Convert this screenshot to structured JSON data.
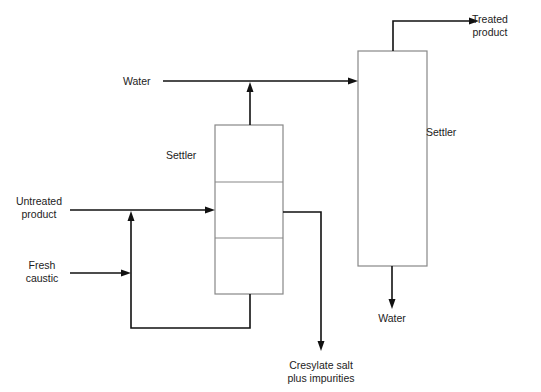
{
  "diagram": {
    "type": "process-flow",
    "colors": {
      "flow_line": "#111111",
      "vessel_outline": "#888888",
      "text": "#222222",
      "background": "#ffffff"
    },
    "labels": {
      "water_in": "Water",
      "settler_small": "Settler",
      "settler_tall": "Settler",
      "untreated_line1": "Untreated",
      "untreated_line2": "product",
      "caustic_line1": "Fresh",
      "caustic_line2": "caustic",
      "treated_line1": "Treated",
      "treated_line2": "product",
      "water_out": "Water",
      "cresylate_line1": "Cresylate salt",
      "cresylate_line2": "plus impurities"
    },
    "nodes": [
      {
        "id": "settler-1",
        "label": "Settler",
        "sections": 3
      },
      {
        "id": "settler-2",
        "label": "Settler",
        "sections": 1
      }
    ],
    "streams": [
      {
        "from": "Untreated product",
        "to": "settler-1"
      },
      {
        "from": "Fresh caustic",
        "to": "mixing-point"
      },
      {
        "from": "settler-1 bottom",
        "to": "mixing-point",
        "type": "recycle"
      },
      {
        "from": "settler-1 top",
        "to": "water-line"
      },
      {
        "from": "Water",
        "to": "settler-2"
      },
      {
        "from": "settler-1 side",
        "to": "Cresylate salt plus impurities"
      },
      {
        "from": "settler-2 top",
        "to": "Treated product"
      },
      {
        "from": "settler-2 bottom",
        "to": "Water"
      }
    ]
  }
}
